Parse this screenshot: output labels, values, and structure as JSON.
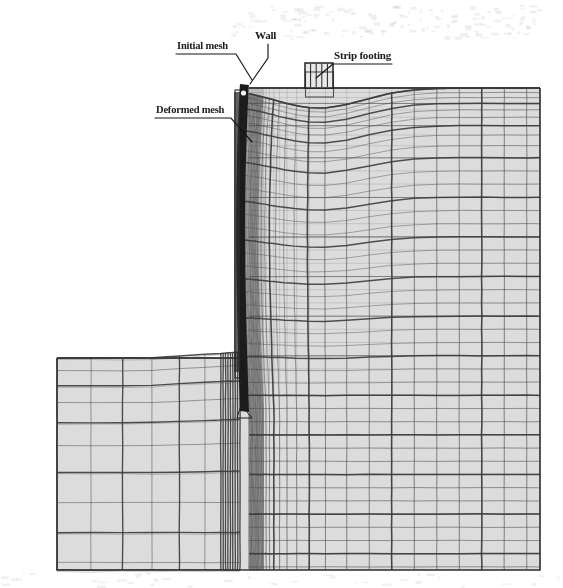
{
  "figure": {
    "title": "",
    "type": "finite-element-mesh-diagram",
    "background_color": "#ffffff",
    "soil_fill_color": "#dcdcdc",
    "mesh_line_color": "#3a3a3a",
    "wall_color": "#1c1c1c",
    "text_color": "#1a1a1a"
  },
  "annotations": {
    "initial_mesh": {
      "label": "Initial mesh",
      "underline": true
    },
    "wall": {
      "label": "Wall",
      "underline": false
    },
    "strip_footing": {
      "label": "Strip footing",
      "underline": true
    },
    "deformed_mesh": {
      "label": "Deformed mesh",
      "underline": true
    }
  },
  "geometry": {
    "domain_left_x": 57,
    "domain_right_x": 540,
    "domain_bottom_y": 570,
    "retained_ground_surface_y": 88,
    "excavation_floor_y": 358,
    "wall_x_left": 240,
    "wall_x_right": 249,
    "wall_top_y": 84,
    "wall_toe_y": 412,
    "footing_left_x": 305,
    "footing_right_x": 333,
    "footing_top_y": 63,
    "footing_base_y": 88
  },
  "chart_data": {
    "type": "mesh",
    "regions": [
      {
        "name": "retained-soil-right",
        "x_range": [
          240,
          540
        ],
        "y_range": [
          88,
          570
        ],
        "vertical_spacing": 22,
        "horizontal_spacing": 13,
        "refined_near_wall": true
      },
      {
        "name": "excavated-soil-left",
        "x_range": [
          57,
          240
        ],
        "y_range": [
          358,
          570
        ],
        "vertical_spacing": 36,
        "horizontal_spacing": 26,
        "refined_near_wall": true
      }
    ],
    "deformation": {
      "settlement_bowl_center_x": 319,
      "settlement_bowl_halfwidth": 70,
      "max_settlement_px": 20,
      "wall_max_deflection_px": 7,
      "heave_at_excavation_base_px": 6
    }
  }
}
